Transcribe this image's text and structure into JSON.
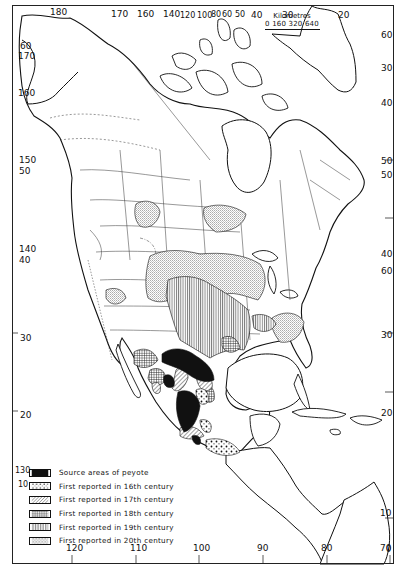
{
  "figure": {
    "scale": {
      "title": "Kilometres",
      "ticks": "0 160 320 640"
    },
    "legend": [
      {
        "pattern": "solid-black",
        "label": "Source areas of peyote"
      },
      {
        "pattern": "dots",
        "label": "First reported in 16th century"
      },
      {
        "pattern": "diagonal-hatch",
        "label": "First reported in 17th century"
      },
      {
        "pattern": "crosshatch",
        "label": "First reported in 18th century"
      },
      {
        "pattern": "vertical-lines",
        "label": "First reported in 19th century"
      },
      {
        "pattern": "fine-stipple",
        "label": "First reported in 20th century"
      }
    ],
    "top_ticks": [
      "180",
      "170",
      "160",
      "140",
      "120",
      "100",
      "80",
      "60",
      "50",
      "40",
      "30",
      "20"
    ],
    "bottom_ticks": [
      "120",
      "110",
      "100",
      "90",
      "80",
      "70"
    ],
    "left_ticks": [
      "60",
      "170",
      "160",
      "150",
      "50",
      "140",
      "40",
      "30",
      "20",
      "130",
      "10"
    ],
    "right_ticks": [
      "60",
      "30",
      "40",
      "50",
      "50",
      "40",
      "60",
      "30",
      "20",
      "10",
      "0"
    ],
    "colors": {
      "ink": "#111111",
      "paper": "#ffffff"
    }
  }
}
